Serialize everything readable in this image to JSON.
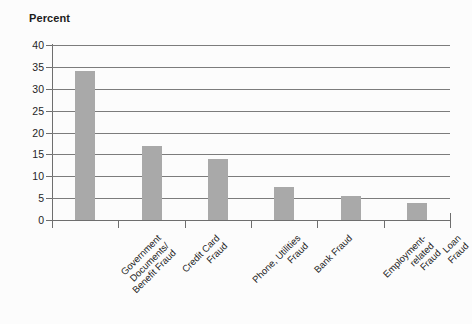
{
  "chart_data": {
    "type": "bar",
    "title": "",
    "ylabel": "Percent",
    "xlabel": "",
    "ylim": [
      0,
      40
    ],
    "yticks": [
      0,
      5,
      10,
      15,
      20,
      25,
      30,
      35,
      40
    ],
    "grid": true,
    "legend": false,
    "bar_color": "#a9a9a9",
    "categories": [
      "Government Documents/ Benefit Fraud",
      "Credit Card Fraud",
      "Phone, Utilities Fraud",
      "Bank Fraud",
      "Employment-related Fraud",
      "Loan Fraud"
    ],
    "category_lines": [
      [
        "Government",
        "Documents/",
        "Benefit Fraud"
      ],
      [
        "Credit Card",
        "Fraud"
      ],
      [
        "Phone, Utilities",
        "Fraud"
      ],
      [
        "Bank Fraud"
      ],
      [
        "Employment-",
        "related",
        "Fraud"
      ],
      [
        "Loan",
        "Fraud"
      ]
    ],
    "values": [
      34,
      17,
      14,
      7.5,
      5.5,
      4
    ]
  },
  "axis": {
    "y_title": "Percent",
    "tick_labels": [
      "40",
      "35",
      "30",
      "25",
      "20",
      "15",
      "10",
      "5",
      "0"
    ]
  }
}
